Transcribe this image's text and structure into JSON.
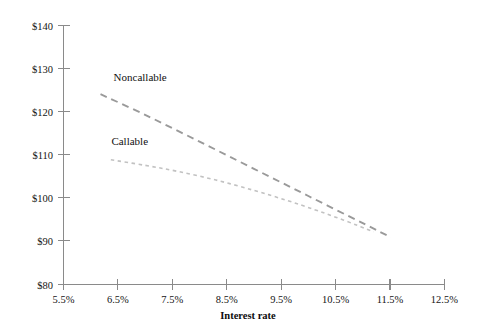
{
  "chart_data": {
    "type": "line",
    "title": "",
    "subtitle": "",
    "xlabel": "Interest rate",
    "ylabel": "",
    "grid": false,
    "legend_position": "inline-labels",
    "xlim": [
      5.5,
      12.5
    ],
    "ylim": [
      80,
      140
    ],
    "x_tick_labels": [
      "5.5%",
      "6.5%",
      "7.5%",
      "8.5%",
      "9.5%",
      "10.5%",
      "11.5%",
      "12.5%"
    ],
    "x_tick_values": [
      5.5,
      6.5,
      7.5,
      8.5,
      9.5,
      10.5,
      11.5,
      12.5
    ],
    "y_tick_labels": [
      "$80",
      "$90",
      "$100",
      "$110",
      "$120",
      "$130",
      "$140"
    ],
    "y_tick_values": [
      80,
      90,
      100,
      110,
      120,
      130,
      140
    ],
    "series": [
      {
        "name": "Noncallable",
        "style": "dashed",
        "color": "#9a9a9a",
        "label_x": 6.42,
        "label_y": 127.2,
        "x": [
          6.18,
          7.0,
          8.0,
          9.0,
          10.0,
          11.0,
          11.52
        ],
        "y": [
          124.1,
          119.3,
          113.1,
          106.8,
          100.5,
          94.2,
          90.9
        ]
      },
      {
        "name": "Callable",
        "style": "dotted",
        "color": "#c2c2c2",
        "label_x": 6.38,
        "label_y": 112.3,
        "x": [
          6.37,
          7.0,
          7.6,
          8.3,
          9.0,
          9.6,
          10.1,
          10.5,
          10.9,
          11.2
        ],
        "y": [
          108.9,
          107.6,
          106.2,
          104.2,
          101.8,
          99.5,
          97.4,
          95.6,
          93.7,
          92.2
        ]
      }
    ]
  },
  "labels": {
    "noncallable": "Noncallable",
    "callable": "Callable",
    "xaxis_title": "Interest rate"
  },
  "ticks": {
    "x": [
      "5.5%",
      "6.5%",
      "7.5%",
      "8.5%",
      "9.5%",
      "10.5%",
      "11.5%",
      "12.5%"
    ],
    "y": [
      "$140",
      "$130",
      "$120",
      "$110",
      "$100",
      "$90",
      "$80"
    ]
  },
  "colors": {
    "axis": "#8a8a8a",
    "noncallable_line": "#9a9a9a",
    "callable_line": "#c2c2c2",
    "text": "#141414",
    "background": "#ffffff"
  }
}
